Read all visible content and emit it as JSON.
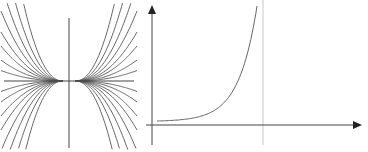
{
  "chart_data": [
    {
      "type": "line",
      "title": "",
      "description": "Family of curves y = C*x^n (symmetric about the vertical axis), all flattening to the origin",
      "xlabel": "",
      "ylabel": "",
      "grid": false,
      "legend": null,
      "axes": {
        "x_axis_y_px": 81,
        "y_axis_x_px": 69
      },
      "series_count": 16,
      "coefficients": [
        -3,
        -2,
        -1.4,
        -1,
        -0.7,
        -0.5,
        -0.3,
        -0.15,
        0.15,
        0.3,
        0.5,
        0.7,
        1,
        1.4,
        2,
        3
      ]
    },
    {
      "type": "line",
      "title": "",
      "description": "Exponential growth curve rising steeply toward a vertical line",
      "xlabel": "",
      "ylabel": "",
      "grid": false,
      "legend": null,
      "arrows": [
        "x-axis",
        "y-axis"
      ],
      "vertical_reference_line": true,
      "x": [
        0,
        0.2,
        0.4,
        0.5,
        0.6,
        0.7,
        0.8,
        0.9,
        1.0
      ],
      "values": [
        0.03,
        0.04,
        0.07,
        0.1,
        0.15,
        0.23,
        0.38,
        0.62,
        1.0
      ]
    }
  ],
  "colors": {
    "curve": "#555555",
    "axis": "#444444",
    "guide": "#bbbbbb"
  }
}
